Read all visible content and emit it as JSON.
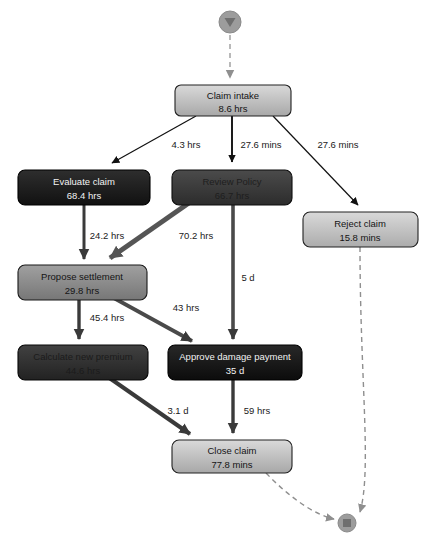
{
  "diagram": {
    "type": "process-flow-map",
    "canvas": {
      "width": 435,
      "height": 545
    },
    "start_node": {
      "name": "start-event",
      "shape": "circle-with-triangle",
      "cx": 230,
      "cy": 22,
      "r": 11,
      "color": "#9c9c9c"
    },
    "end_node": {
      "name": "end-event",
      "shape": "circle-with-square",
      "cx": 347,
      "cy": 523,
      "r": 9,
      "color": "#9c9c9c"
    },
    "nodes": [
      {
        "id": "claim-intake",
        "label": "Claim intake",
        "metric": "8.6 hrs",
        "x": 175,
        "y": 85,
        "w": 116,
        "h": 31,
        "fill_top": "#d6d6d6",
        "fill_bottom": "#aeaeae",
        "text_color": "#141414"
      },
      {
        "id": "evaluate-claim",
        "label": "Evaluate claim",
        "metric": "68.4 hrs",
        "x": 18,
        "y": 170,
        "w": 132,
        "h": 35,
        "fill_top": "#2a2a2a",
        "fill_bottom": "#141414",
        "text_color": "#f2f2f2"
      },
      {
        "id": "review-policy",
        "label": "Review Policy",
        "metric": "66.7 hrs",
        "x": 172,
        "y": 170,
        "w": 120,
        "h": 35,
        "fill_top": "#464646",
        "fill_bottom": "#303030",
        "text_color": "#1c1c1c"
      },
      {
        "id": "reject-claim",
        "label": "Reject claim",
        "metric": "15.8 mins",
        "x": 303,
        "y": 212,
        "w": 115,
        "h": 35,
        "fill_top": "#d6d6d6",
        "fill_bottom": "#b0b0b0",
        "text_color": "#141414"
      },
      {
        "id": "propose-settlement",
        "label": "Propose settlement",
        "metric": "29.8 hrs",
        "x": 18,
        "y": 265,
        "w": 129,
        "h": 35,
        "fill_top": "#9a9a9a",
        "fill_bottom": "#7c7c7c",
        "text_color": "#141414"
      },
      {
        "id": "calculate-premium",
        "label": "Calculate new premium",
        "metric": "44.6 hrs",
        "x": 18,
        "y": 345,
        "w": 130,
        "h": 35,
        "fill_top": "#3c3c3c",
        "fill_bottom": "#272727",
        "text_color": "#1a1a1a"
      },
      {
        "id": "approve-damage",
        "label": "Approve damage payment",
        "metric": "35 d",
        "x": 168,
        "y": 345,
        "w": 134,
        "h": 35,
        "fill_top": "#252525",
        "fill_bottom": "#101010",
        "text_color": "#f2f2f2"
      },
      {
        "id": "close-claim",
        "label": "Close claim",
        "metric": "77.8 mins",
        "x": 172,
        "y": 440,
        "w": 120,
        "h": 33,
        "fill_top": "#d6d6d6",
        "fill_bottom": "#aeaeae",
        "text_color": "#141414"
      }
    ],
    "edges": [
      {
        "id": "start-to-intake",
        "from": "start-event",
        "to": "claim-intake",
        "label": "",
        "style": "dashed",
        "width": 1.4,
        "color": "#9c9c9c",
        "label_x": 0,
        "label_y": 0
      },
      {
        "id": "intake-to-evaluate",
        "from": "claim-intake",
        "to": "evaluate-claim",
        "label": "4.3 hrs",
        "style": "solid",
        "width": 1.2,
        "color": "#111111",
        "label_x": 186,
        "label_y": 145
      },
      {
        "id": "intake-to-review",
        "from": "claim-intake",
        "to": "review-policy",
        "label": "27.6 mins",
        "style": "solid",
        "width": 1.6,
        "color": "#111111",
        "label_x": 261,
        "label_y": 145
      },
      {
        "id": "intake-to-reject",
        "from": "claim-intake",
        "to": "reject-claim",
        "label": "27.6 mins",
        "style": "solid",
        "width": 1.2,
        "color": "#111111",
        "label_x": 337,
        "label_y": 145
      },
      {
        "id": "evaluate-to-propose",
        "from": "evaluate-claim",
        "to": "propose-settlement",
        "label": "24.2 hrs",
        "style": "solid",
        "width": 3.0,
        "color": "#3a3a3a",
        "label_x": 107,
        "label_y": 236
      },
      {
        "id": "review-to-propose",
        "from": "review-policy",
        "to": "propose-settlement",
        "label": "70.2 hrs",
        "style": "solid",
        "width": 5.0,
        "color": "#555555",
        "label_x": 196,
        "label_y": 236
      },
      {
        "id": "review-to-approve",
        "from": "review-policy",
        "to": "approve-damage",
        "label": "5 d",
        "style": "solid",
        "width": 3.6,
        "color": "#4a4a4a",
        "label_x": 248,
        "label_y": 278
      },
      {
        "id": "propose-to-calculate",
        "from": "propose-settlement",
        "to": "calculate-premium",
        "label": "45.4 hrs",
        "style": "solid",
        "width": 3.4,
        "color": "#3a3a3a",
        "label_x": 107,
        "label_y": 318
      },
      {
        "id": "propose-to-approve",
        "from": "propose-settlement",
        "to": "approve-damage",
        "label": "43 hrs",
        "style": "solid",
        "width": 3.8,
        "color": "#4a4a4a",
        "label_x": 185,
        "label_y": 308
      },
      {
        "id": "calculate-to-close",
        "from": "calculate-premium",
        "to": "close-claim",
        "label": "3.1 d",
        "style": "solid",
        "width": 4.0,
        "color": "#3a3a3a",
        "label_x": 178,
        "label_y": 411
      },
      {
        "id": "approve-to-close",
        "from": "approve-damage",
        "to": "close-claim",
        "label": "59 hrs",
        "style": "solid",
        "width": 3.4,
        "color": "#3a3a3a",
        "label_x": 256,
        "label_y": 411
      },
      {
        "id": "reject-to-end",
        "from": "reject-claim",
        "to": "end-event",
        "label": "",
        "style": "dashed",
        "width": 1.4,
        "color": "#8f8f8f",
        "label_x": 0,
        "label_y": 0
      },
      {
        "id": "close-to-end",
        "from": "close-claim",
        "to": "end-event",
        "label": "",
        "style": "dashed",
        "width": 1.4,
        "color": "#8f8f8f",
        "label_x": 0,
        "label_y": 0
      }
    ]
  }
}
